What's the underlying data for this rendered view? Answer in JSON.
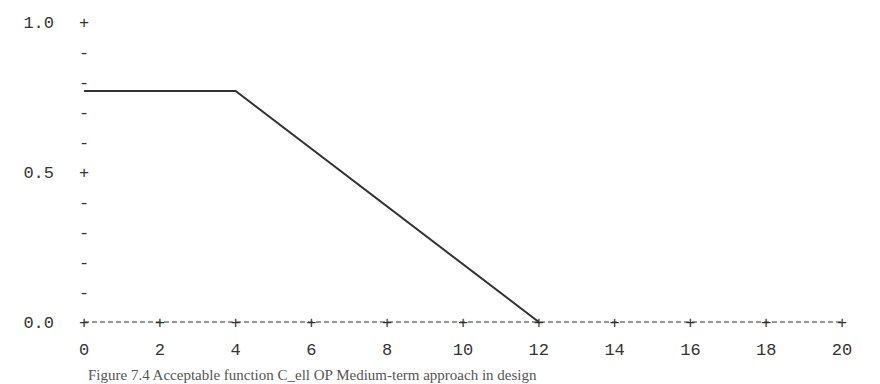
{
  "chart_data": {
    "type": "line",
    "title": "",
    "xlabel": "",
    "ylabel": "",
    "xlim": [
      0,
      20
    ],
    "ylim": [
      0,
      1.0
    ],
    "x_ticks": [
      "0",
      "2",
      "4",
      "6",
      "8",
      "10",
      "12",
      "14",
      "16",
      "18",
      "20"
    ],
    "y_ticks": [
      "0.0",
      "0.5",
      "1.0"
    ],
    "grid": false,
    "legend": null,
    "series": [
      {
        "name": "acceptable function",
        "x": [
          0,
          4,
          12,
          20
        ],
        "y": [
          0.77,
          0.77,
          0.0,
          0.0
        ]
      }
    ]
  },
  "caption": "Figure 7.4  Acceptable function C_ell OP Medium-term approach in design",
  "colors": {
    "line": "#333333",
    "axis": "#333333"
  }
}
